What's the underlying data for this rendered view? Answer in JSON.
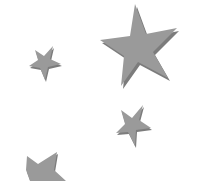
{
  "canvas": {
    "width": 200,
    "height": 181,
    "background": "#ffffff"
  },
  "colors": {
    "star_fill": "#9a9a9a",
    "star_shadow": "#7c7c7c"
  },
  "stars": [
    {
      "name": "large-star",
      "points": "135,4 146,34 177,28 153,52 168,78 138,62 121,86 124,56 100,40 130,36"
    },
    {
      "name": "small-star-left",
      "points": "53,46 50,59 61,64 48,67 45,80 40,68 29,66 38,60 35,50 44,56"
    },
    {
      "name": "small-star-middle",
      "points": "143,105 139,120 151,128 136,130 135,146 128,132 116,133 125,124 121,110 132,118"
    },
    {
      "name": "partial-star-bottom",
      "points": "57,152 54,170 66,181 48,181 30,181 26,170 27,156 38,164"
    }
  ]
}
